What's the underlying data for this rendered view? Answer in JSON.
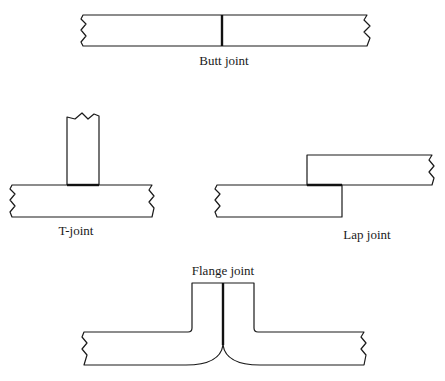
{
  "diagram": {
    "type": "weld joint types",
    "joints": [
      {
        "id": "butt",
        "label": "Butt joint"
      },
      {
        "id": "t",
        "label": "T-joint"
      },
      {
        "id": "lap",
        "label": "Lap joint"
      },
      {
        "id": "flange",
        "label": "Flange joint"
      }
    ],
    "colors": {
      "line": "#1a1a1a",
      "background": "#ffffff"
    }
  }
}
